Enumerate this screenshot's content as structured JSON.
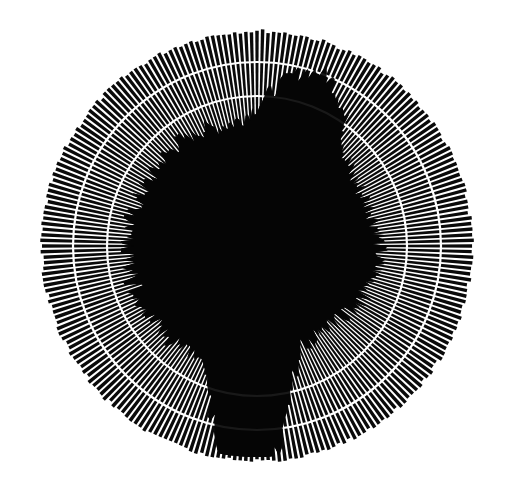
{
  "image": {
    "width": 510,
    "height": 495,
    "background": "#ffffff",
    "ink": "#0a0a0a",
    "description": "Radial starburst pattern with dense black rays and concentric white rings"
  },
  "pattern": {
    "center": [
      257,
      246
    ],
    "outer_radius": 217,
    "ray_count": 240,
    "ray_duty": 0.62,
    "rings": [
      {
        "radius": 184,
        "width": 2.2,
        "color": "#ffffff"
      },
      {
        "radius": 150,
        "width": 2.2,
        "color": "#ffffff"
      }
    ],
    "core": {
      "base_radius": 105,
      "color": "#050505",
      "lobes": [
        {
          "angle_deg": -70,
          "extent": 130,
          "spread_deg": 14
        },
        {
          "angle_deg": 92,
          "extent": 210,
          "spread_deg": 10
        },
        {
          "angle_deg": 180,
          "extent": 40,
          "spread_deg": 30
        },
        {
          "angle_deg": 0,
          "extent": 30,
          "spread_deg": 30
        },
        {
          "angle_deg": -120,
          "extent": 35,
          "spread_deg": 20
        },
        {
          "angle_deg": 120,
          "extent": 30,
          "spread_deg": 25
        }
      ]
    }
  }
}
